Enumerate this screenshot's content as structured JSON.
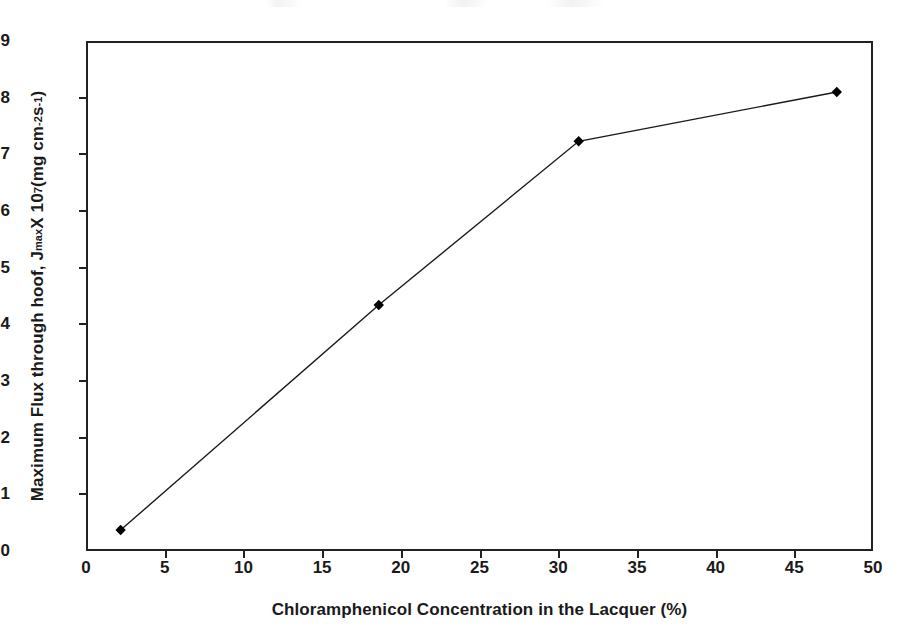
{
  "chart_data": {
    "type": "line",
    "title": "",
    "xlabel": "Chloramphenicol Concentration in the Lacquer (%)",
    "ylabel_plain": "Maximum Flux through hoof, Jmax X 10^7 (mg cm^-2 s^-1)",
    "ylabel_parts": {
      "lead": "Maximum Flux through hoof, J",
      "sub1": "max",
      "mid": " X 10",
      "sup1": "7",
      "mid2": " (mg cm",
      "sup2": "-2",
      "mid3": "s",
      "sup3": "-1",
      "tail": ")"
    },
    "x": [
      2.2,
      18.6,
      31.3,
      47.7
    ],
    "values": [
      0.37,
      4.34,
      7.23,
      8.1
    ],
    "series": [
      {
        "name": "Maximum flux through hoof",
        "points": [
          {
            "x": 2.2,
            "y": 0.37
          },
          {
            "x": 18.6,
            "y": 4.34
          },
          {
            "x": 31.3,
            "y": 7.23
          },
          {
            "x": 47.7,
            "y": 8.1
          }
        ]
      }
    ],
    "xlim": [
      0,
      50
    ],
    "ylim": [
      0,
      9
    ],
    "xticks": [
      0,
      5,
      10,
      15,
      20,
      25,
      30,
      35,
      40,
      45,
      50
    ],
    "yticks": [
      0,
      1,
      2,
      3,
      4,
      5,
      6,
      7,
      8,
      9
    ],
    "xtick_labels": [
      "0",
      "5",
      "10",
      "15",
      "20",
      "25",
      "30",
      "35",
      "40",
      "45",
      "50"
    ],
    "ytick_labels": [
      "0",
      "1",
      "2",
      "3",
      "4",
      "5",
      "6",
      "7",
      "8",
      "9"
    ],
    "grid": false,
    "legend": false,
    "legend_position": "none",
    "marker": "diamond",
    "marker_color": "#000000",
    "line_color": "#1a1a1a",
    "line_width": 1.4,
    "frame_color": "#222222",
    "background_color": "#ffffff",
    "annotations": []
  }
}
